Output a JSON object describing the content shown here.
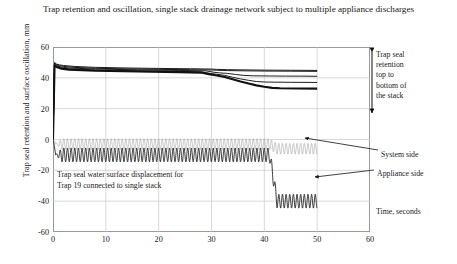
{
  "chart_data": {
    "type": "line",
    "title": "Trap retention and oscillation, single stack drainage network subject to multiple\nappliance discharges",
    "xlabel": "Time, seconds",
    "ylabel": "Trap seal retention and surface oscillation, mm",
    "xlim": [
      0,
      60
    ],
    "ylim": [
      -60,
      60
    ],
    "xticks": [
      0,
      10,
      20,
      30,
      40,
      50,
      60
    ],
    "yticks": [
      -60,
      -40,
      -20,
      0,
      20,
      40,
      60
    ],
    "grid": true,
    "legend": "none",
    "annotations": [
      {
        "name": "trap-seal-retention-bracket",
        "text": "Trap seal\nretention\ntop to\nbottom of\nthe stack",
        "x_px": 376,
        "y_px": 50
      },
      {
        "name": "system-side-label",
        "text": "System side",
        "x_px": 381,
        "y_px": 150
      },
      {
        "name": "appliance-side-label",
        "text": "Appliance side",
        "x_px": 377,
        "y_px": 169
      },
      {
        "name": "time-axis-label",
        "text": "Time, seconds",
        "x_px": 376,
        "y_px": 207
      },
      {
        "name": "in-plot-note",
        "text": "Trap seal water surface displacement for\nTrap 19 connected to single stack",
        "x_px": 57,
        "y_px": 170
      }
    ],
    "series": [
      {
        "name": "trap-seal-retention-top-of-stack",
        "style": "thin-black",
        "x": [
          0,
          0.3,
          0.6,
          1.2,
          2,
          4,
          8,
          14,
          20,
          26,
          30,
          31,
          32,
          33,
          35,
          40,
          45,
          50
        ],
        "values": [
          0,
          50,
          49,
          48.4,
          48,
          47.4,
          46.8,
          46.4,
          46.1,
          45.9,
          45.7,
          45.5,
          45.4,
          45.3,
          45.2,
          45,
          44.9,
          44.8
        ]
      },
      {
        "name": "trap-seal-retention-upper-mid",
        "style": "thin-black",
        "x": [
          0,
          0.3,
          0.6,
          1.2,
          2,
          4,
          8,
          14,
          20,
          26,
          30,
          31,
          32,
          33,
          35,
          40,
          45,
          50
        ],
        "values": [
          0,
          49.6,
          48.6,
          47.9,
          47.4,
          46.8,
          46.2,
          45.8,
          45.5,
          45.3,
          45.1,
          44.9,
          44.8,
          44.7,
          44.6,
          44.4,
          44.3,
          44.2
        ]
      },
      {
        "name": "trap-seal-retention-mid",
        "style": "thin-black",
        "x": [
          0,
          0.3,
          0.6,
          1.5,
          3,
          8,
          16,
          24,
          29,
          30.5,
          31.5,
          33,
          34.5,
          36,
          38,
          41,
          44,
          47,
          50
        ],
        "values": [
          0,
          49,
          48,
          47,
          46.4,
          45.7,
          45.2,
          44.8,
          44.5,
          43.6,
          43.2,
          42.9,
          42.2,
          41.6,
          41.3,
          41.2,
          41.1,
          41.1,
          41.0
        ]
      },
      {
        "name": "trap-seal-retention-lower-mid",
        "style": "thin-black",
        "x": [
          0,
          0.3,
          0.7,
          1.5,
          3,
          8,
          16,
          24,
          28,
          29.5,
          31,
          32.5,
          34,
          35.5,
          37,
          38.5,
          40,
          42,
          45,
          50
        ],
        "values": [
          0,
          48.5,
          47.4,
          46.4,
          45.8,
          45.1,
          44.6,
          44.2,
          43.9,
          43.0,
          42.3,
          41.6,
          40.4,
          39.3,
          38.4,
          37.6,
          37.3,
          37.2,
          37.1,
          37.0
        ]
      },
      {
        "name": "trap-seal-retention-bottom-of-stack",
        "style": "thick-black",
        "x": [
          0,
          0.3,
          0.8,
          1.6,
          3,
          8,
          16,
          24,
          28,
          29.5,
          31,
          32.5,
          34,
          35.5,
          37,
          38.5,
          40,
          41.5,
          43,
          46,
          50
        ],
        "values": [
          0,
          48,
          46.8,
          45.9,
          45.3,
          44.6,
          44.1,
          43.7,
          43.4,
          42.4,
          41.5,
          40.6,
          39.1,
          37.6,
          36.3,
          35.1,
          34.2,
          33.5,
          33.2,
          33.1,
          33.0
        ]
      },
      {
        "name": "system-side-oscillation-envelope",
        "style": "light-gray-oscillation",
        "description": "High-frequency system-side surface oscillation, upper envelope near 0 mm, lower envelope near -6 mm, dropping after ~41 s",
        "baseline": -3,
        "amplitude": 3.5,
        "frequency_hz": 1.45,
        "drop_time": 41,
        "drop_baseline": -6,
        "x_start": 0.5,
        "x_end": 50
      },
      {
        "name": "appliance-side-oscillation",
        "style": "dark-oscillation",
        "description": "Appliance-side trap seal water surface displacement for Trap 19, oscillating about -10 mm then dropping to about -40 mm after 41 s",
        "baseline": -10,
        "amplitude": 4.5,
        "frequency_hz": 1.45,
        "drop_time": 41,
        "drop_baseline": -40,
        "x_start": 0.5,
        "x_end": 50
      }
    ]
  }
}
